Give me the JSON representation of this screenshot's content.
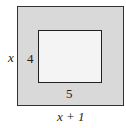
{
  "diagram": {
    "outer_rect": {
      "width_label": "x + 1",
      "height_label": "x",
      "fill": "#d9d9d9"
    },
    "inner_rect": {
      "width_label": "5",
      "height_label": "4",
      "fill": "#f4f4f4"
    }
  }
}
